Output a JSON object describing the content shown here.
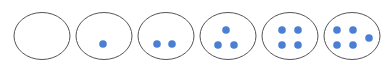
{
  "diagram": {
    "colors": {
      "outline": "#555555",
      "dot": "#4a7fd4",
      "background": "#ffffff"
    },
    "groups": [
      {
        "count": 0,
        "cx": 42,
        "cy": 36,
        "dots": []
      },
      {
        "count": 1,
        "cx": 104,
        "cy": 36,
        "dots": [
          [
            103,
            44
          ]
        ]
      },
      {
        "count": 2,
        "cx": 166,
        "cy": 36,
        "dots": [
          [
            157,
            44
          ],
          [
            172,
            44
          ]
        ]
      },
      {
        "count": 3,
        "cx": 228,
        "cy": 36,
        "dots": [
          [
            226,
            30
          ],
          [
            218,
            45
          ],
          [
            234,
            45
          ]
        ]
      },
      {
        "count": 4,
        "cx": 290,
        "cy": 36,
        "dots": [
          [
            282,
            30
          ],
          [
            298,
            30
          ],
          [
            282,
            45
          ],
          [
            298,
            45
          ]
        ]
      },
      {
        "count": 5,
        "cx": 352,
        "cy": 36,
        "dots": [
          [
            337,
            30
          ],
          [
            353,
            30
          ],
          [
            337,
            45
          ],
          [
            353,
            45
          ],
          [
            369,
            38
          ]
        ]
      }
    ]
  }
}
